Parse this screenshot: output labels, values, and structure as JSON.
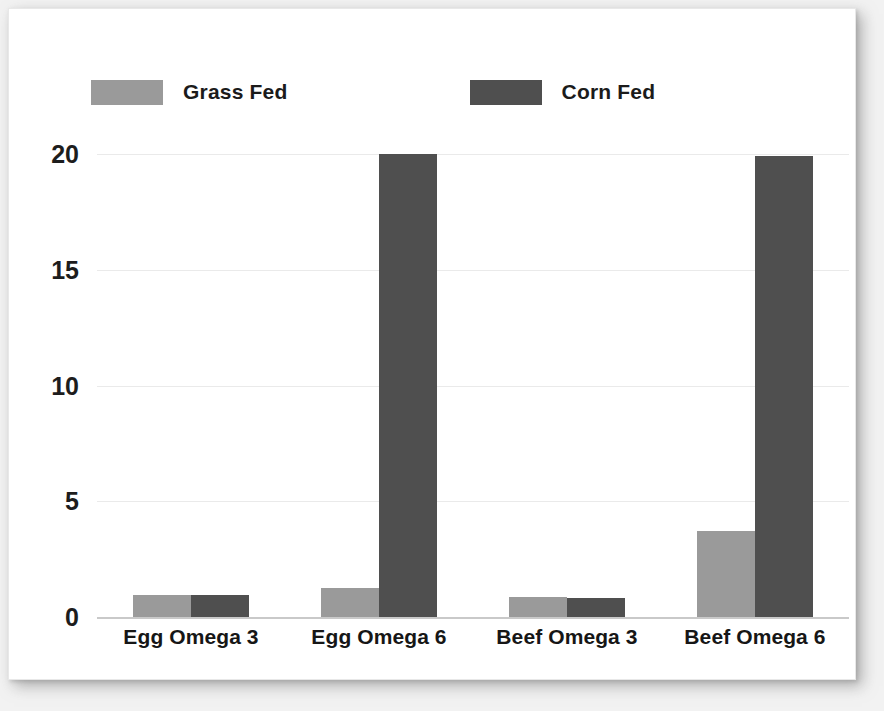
{
  "chart_data": {
    "type": "bar",
    "title": "",
    "xlabel": "",
    "ylabel": "",
    "categories": [
      "Egg Omega 3",
      "Egg Omega 6",
      "Beef Omega 3",
      "Beef Omega 6"
    ],
    "series": [
      {
        "name": "Grass Fed",
        "color": "#9a9a9a",
        "values": [
          0.95,
          1.25,
          0.85,
          3.7
        ]
      },
      {
        "name": "Corn Fed",
        "color": "#4f4f4f",
        "values": [
          0.95,
          20.0,
          0.8,
          19.9
        ]
      }
    ],
    "ylim": [
      0,
      20
    ],
    "yticks": [
      20,
      15,
      10,
      5,
      0
    ],
    "ytick_labels": [
      "20",
      "15",
      "10",
      "5",
      "0"
    ],
    "grid": true,
    "legend_position": "top-left"
  },
  "colors": {
    "grass_fed": "#9a9a9a",
    "corn_fed": "#4f4f4f",
    "gridline": "#eaeaea",
    "axis": "#c9c9c9",
    "text": "#1b1b1b",
    "card_background": "#ffffff",
    "page_background": "#f2f2f2"
  }
}
